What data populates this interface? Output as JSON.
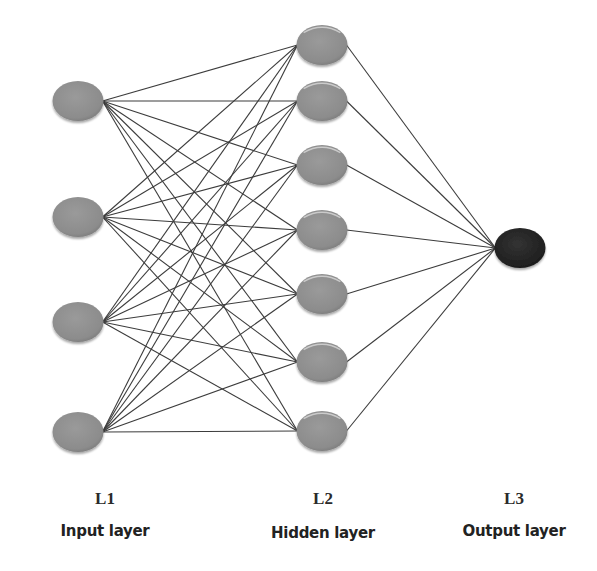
{
  "diagram": {
    "type": "feedforward neural network",
    "colors": {
      "background": "#ffffff",
      "input_node": "#8f8f8f",
      "hidden_node": "#8f8f8f",
      "output_node": "#262626",
      "edge": "#3c3c3c"
    },
    "node_size": {
      "rx": 25.5,
      "ry": 20
    },
    "layers": [
      {
        "id": "L1",
        "name": "Input layer",
        "x": 78,
        "nodes_y": [
          101,
          217,
          322,
          432
        ],
        "label_x": 105
      },
      {
        "id": "L2",
        "name": "Hidden layer",
        "x": 322,
        "nodes_y": [
          45,
          101,
          165,
          230,
          294,
          362,
          431
        ],
        "label_x": 323
      },
      {
        "id": "L3",
        "name": "Output layer",
        "x": 520,
        "nodes_y": [
          248
        ],
        "label_x": 514
      }
    ],
    "connections": "fully connected L1→L2 (28 edges), L2→L3 (7 edges)"
  },
  "labels": {
    "l1_id": "L1",
    "l1_name": "Input layer",
    "l2_id": "L2",
    "l2_name": "Hidden layer",
    "l3_id": "L3",
    "l3_name": "Output layer"
  }
}
